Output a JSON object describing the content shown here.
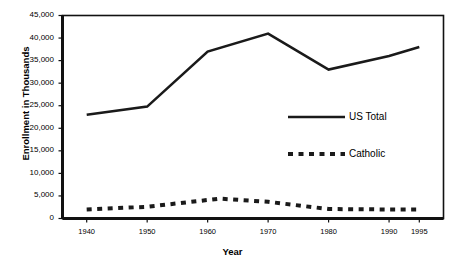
{
  "chart_data": {
    "type": "line",
    "title": "",
    "xlabel": "Year",
    "ylabel": "Enrollment in Thousands",
    "x": [
      1940,
      1950,
      1960,
      1970,
      1980,
      1990,
      1995
    ],
    "xlim": [
      1936,
      1999
    ],
    "ylim": [
      0,
      45000
    ],
    "ytick_labels": [
      "0",
      "5,000",
      "10,000",
      "15,000",
      "20,000",
      "25,000",
      "30,000",
      "35,000",
      "40,000",
      "45,000"
    ],
    "ytick_values": [
      0,
      5000,
      10000,
      15000,
      20000,
      25000,
      30000,
      35000,
      40000,
      45000
    ],
    "xtick_labels": [
      "1940",
      "1950",
      "1960",
      "1970",
      "1980",
      "1990",
      "1995"
    ],
    "xtick_values": [
      1940,
      1950,
      1960,
      1970,
      1980,
      1990,
      1995
    ],
    "grid": false,
    "legend_position": "inside-right",
    "series": [
      {
        "name": "US Total",
        "style": "solid",
        "color": "#1a1a1a",
        "x": [
          1940,
          1950,
          1960,
          1970,
          1980,
          1990,
          1995
        ],
        "values": [
          23000,
          24800,
          37000,
          41000,
          33000,
          36000,
          38000
        ]
      },
      {
        "name": "Catholic",
        "style": "dashed",
        "color": "#1a1a1a",
        "x": [
          1940,
          1950,
          1960,
          1962,
          1970,
          1980,
          1990,
          1995
        ],
        "values": [
          2000,
          2600,
          4100,
          4400,
          3700,
          2100,
          2000,
          2000
        ]
      }
    ]
  },
  "legend": {
    "items": [
      {
        "label": "US Total"
      },
      {
        "label": "Catholic"
      }
    ]
  },
  "axes": {
    "y_title": "Enrollment in Thousands",
    "x_title": "Year"
  }
}
